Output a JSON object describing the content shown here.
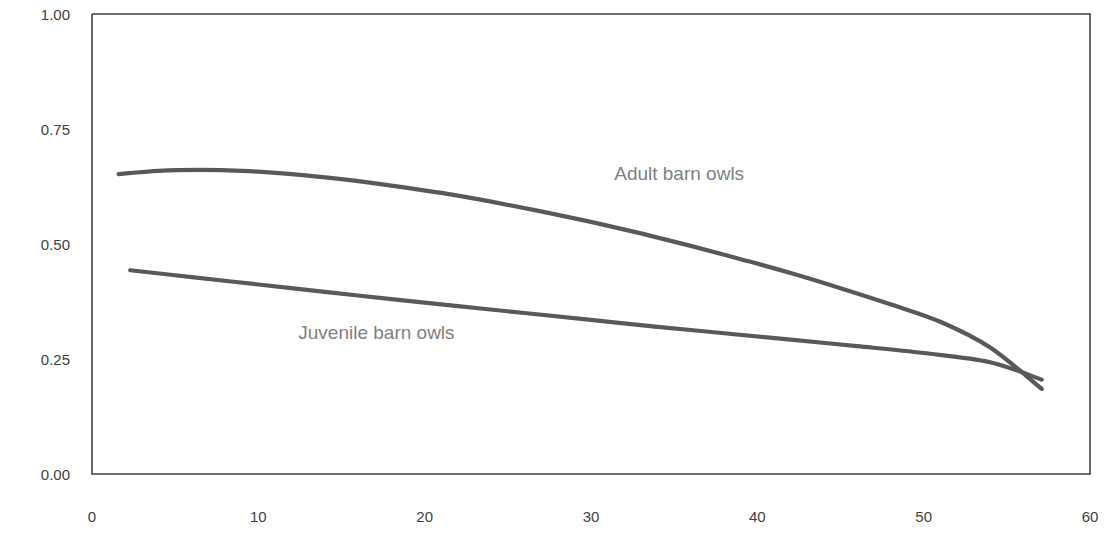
{
  "chart_data": {
    "type": "line",
    "title": "",
    "xlabel": "",
    "ylabel": "",
    "xlim": [
      0,
      60
    ],
    "ylim": [
      0.0,
      1.0
    ],
    "grid": false,
    "legend_position": "inline-annotation",
    "axis_line_color": "#404040",
    "series_color": "#595959",
    "label_color": "#7f7f7f",
    "tick_color": "#404040",
    "y_ticks": [
      "1.00",
      "0.75",
      "0.50",
      "0.25",
      "0.00"
    ],
    "y_tick_values": [
      1.0,
      0.75,
      0.5,
      0.25,
      0.0
    ],
    "x_ticks": [
      "0",
      "10",
      "20",
      "30",
      "40",
      "50",
      "60"
    ],
    "x_tick_values": [
      0,
      10,
      20,
      30,
      40,
      50,
      60
    ],
    "series": [
      {
        "name": "Adult barn owls",
        "annotation": "Adult barn owls",
        "annotation_x": 35.3,
        "annotation_y": 0.655,
        "x": [
          1.6,
          4.0,
          6.5,
          9.0,
          12.0,
          15.0,
          18.0,
          21.0,
          24.0,
          27.0,
          30.0,
          33.0,
          36.0,
          39.0,
          42.0,
          45.0,
          48.0,
          51.0,
          54.0,
          57.1
        ],
        "values": [
          0.652,
          0.659,
          0.661,
          0.659,
          0.652,
          0.641,
          0.627,
          0.611,
          0.592,
          0.571,
          0.548,
          0.523,
          0.496,
          0.467,
          0.437,
          0.404,
          0.369,
          0.331,
          0.275,
          0.185
        ]
      },
      {
        "name": "Juvenile barn owls",
        "annotation": "Juvenile barn owls",
        "annotation_x": 17.1,
        "annotation_y": 0.309,
        "x": [
          2.3,
          6.0,
          10.0,
          14.0,
          18.0,
          22.0,
          26.0,
          30.0,
          34.0,
          38.0,
          42.0,
          46.0,
          50.0,
          54.0,
          57.1
        ],
        "values": [
          0.443,
          0.428,
          0.412,
          0.396,
          0.38,
          0.365,
          0.35,
          0.335,
          0.32,
          0.306,
          0.292,
          0.278,
          0.263,
          0.243,
          0.205
        ]
      }
    ]
  },
  "plot_frame": {
    "left_px": 92,
    "right_px": 1090,
    "top_px": 14,
    "bottom_px": 474
  }
}
